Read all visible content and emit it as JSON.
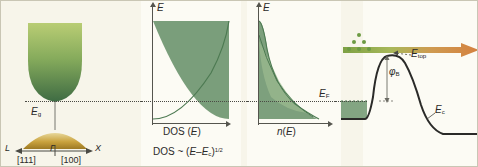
{
  "figure": {
    "background_color": "#f7f5ea",
    "band_green": "#5f8f5f",
    "band_light_green": "#a9c46a",
    "valence_gold": "#c8a23c",
    "dot_green": "#6c9a43",
    "arrow_orange": "#d4813f",
    "line_color": "#2a2a28"
  },
  "panel1": {
    "name": "band-structure",
    "gap_label": "E",
    "gap_sub": "g",
    "left_point": "L",
    "gamma_point": "Γ",
    "right_point": "X",
    "left_direction": "[111]",
    "right_direction": "[100]"
  },
  "panel2": {
    "name": "density-of-states",
    "y_axis": "E",
    "x_axis_pre": "DOS (",
    "x_axis_var": "E",
    "x_axis_post": ")",
    "formula_lead": "DOS ~ (",
    "formula_var1": "E",
    "formula_minus": "–",
    "formula_var2": "E",
    "formula_sub2": "c",
    "formula_close": ")",
    "formula_exp": "1/2"
  },
  "panel3": {
    "name": "carrier-concentration",
    "y_axis": "E",
    "x_axis_var": "n",
    "x_axis_open": "(",
    "x_axis_inner": "E",
    "x_axis_close": ")",
    "fermi_label": "E",
    "fermi_sub": "F"
  },
  "panel4": {
    "name": "schottky-barrier",
    "etop_label": "E",
    "etop_sub": "top",
    "phi_label": "φ",
    "phi_sub": "B",
    "ec_label": "E",
    "ec_sub": "c",
    "dot_count": 6
  }
}
